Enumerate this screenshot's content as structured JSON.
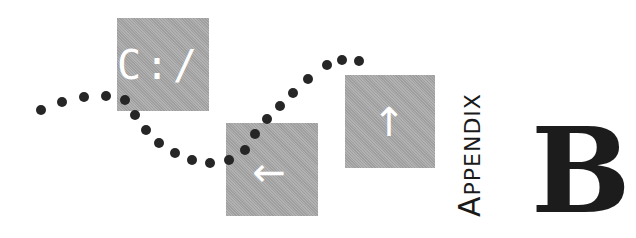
{
  "icons": [
    {
      "name": "command-prompt",
      "glyph": "C:/"
    },
    {
      "name": "arrow-left",
      "glyph": "←"
    },
    {
      "name": "arrow-up",
      "glyph": "↑"
    }
  ],
  "heading": {
    "label_first": "A",
    "label_rest": "PPENDIX",
    "letter": "B"
  },
  "colors": {
    "box": "#a9a9a9",
    "dots": "#262626",
    "text": "#1a1a1a",
    "glyph": "#ffffff"
  },
  "dots": [
    [
      41,
      110
    ],
    [
      62,
      102
    ],
    [
      84,
      97
    ],
    [
      106,
      96
    ],
    [
      125,
      100
    ],
    [
      135,
      115
    ],
    [
      146,
      130
    ],
    [
      159,
      143
    ],
    [
      175,
      153
    ],
    [
      192,
      160
    ],
    [
      210,
      163
    ],
    [
      229,
      160
    ],
    [
      245,
      150
    ],
    [
      255,
      134
    ],
    [
      267,
      119
    ],
    [
      280,
      106
    ],
    [
      293,
      93
    ],
    [
      308,
      79
    ],
    [
      327,
      65
    ],
    [
      342,
      60
    ],
    [
      359,
      61
    ]
  ]
}
